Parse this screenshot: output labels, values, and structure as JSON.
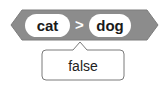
{
  "block": {
    "type": "operator_gt",
    "shape": "hexagon",
    "color": "#8c8c8c",
    "left_input": "cat",
    "operator_symbol": ">",
    "right_input": "dog"
  },
  "report_bubble": {
    "value": "false",
    "border_color": "#7a7a7a",
    "background": "#ffffff"
  }
}
